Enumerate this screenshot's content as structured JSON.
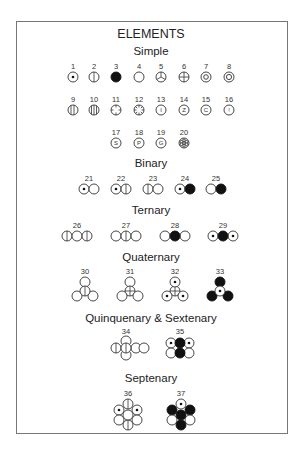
{
  "title": "ELEMENTS",
  "sections": {
    "simple": "Simple",
    "binary": "Binary",
    "ternary": "Ternary",
    "quaternary": "Quaternary",
    "quinquenary_sextenary": "Quinquenary & Sextenary",
    "septenary": "Septenary"
  },
  "simple": [
    {
      "n": "1",
      "symbol": "dot"
    },
    {
      "n": "2",
      "symbol": "vertical-line"
    },
    {
      "n": "3",
      "symbol": "filled"
    },
    {
      "n": "4",
      "symbol": "empty"
    },
    {
      "n": "5",
      "symbol": "y-spokes"
    },
    {
      "n": "6",
      "symbol": "cross"
    },
    {
      "n": "7",
      "symbol": "double-ring"
    },
    {
      "n": "8",
      "symbol": "double-ring"
    },
    {
      "n": "9",
      "symbol": "double-vertical-lines"
    },
    {
      "n": "10",
      "symbol": "triple-vertical-lines"
    },
    {
      "n": "11",
      "symbol": "cross-ticks"
    },
    {
      "n": "12",
      "symbol": "star-ticks"
    },
    {
      "n": "13",
      "symbol": "letter",
      "letter": "I"
    },
    {
      "n": "14",
      "symbol": "letter",
      "letter": "Z"
    },
    {
      "n": "15",
      "symbol": "letter",
      "letter": "C"
    },
    {
      "n": "16",
      "symbol": "letter",
      "letter": "!"
    },
    {
      "n": "17",
      "symbol": "letter",
      "letter": "S"
    },
    {
      "n": "18",
      "symbol": "letter",
      "letter": "P"
    },
    {
      "n": "19",
      "symbol": "letter",
      "letter": "G"
    },
    {
      "n": "20",
      "symbol": "flower"
    }
  ],
  "binary": [
    {
      "n": "21"
    },
    {
      "n": "22"
    },
    {
      "n": "23"
    },
    {
      "n": "24"
    },
    {
      "n": "25"
    }
  ],
  "ternary": [
    {
      "n": "26"
    },
    {
      "n": "27"
    },
    {
      "n": "28"
    },
    {
      "n": "29"
    }
  ],
  "quaternary": [
    {
      "n": "30"
    },
    {
      "n": "31"
    },
    {
      "n": "32"
    },
    {
      "n": "33"
    }
  ],
  "quinquenary_sextenary": [
    {
      "n": "34"
    },
    {
      "n": "35"
    }
  ],
  "septenary": [
    {
      "n": "36"
    },
    {
      "n": "37"
    }
  ]
}
